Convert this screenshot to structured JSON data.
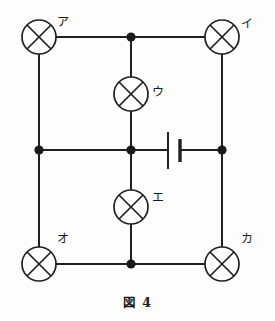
{
  "figure": {
    "caption": "図 4",
    "caption_label": "図",
    "caption_number": "4",
    "line_color": "#231f20",
    "background_color": "#fdfdfc"
  },
  "diagram": {
    "type": "electrical-circuit-schematic",
    "lamps": [
      {
        "id": "lamp-a",
        "label": "ア",
        "cx": 39,
        "cy": 37,
        "r": 17,
        "label_x": 57,
        "label_y": 16,
        "position": "top-left"
      },
      {
        "id": "lamp-i",
        "label": "イ",
        "cx": 222,
        "cy": 37,
        "r": 17,
        "label_x": 241,
        "label_y": 18,
        "position": "top-right"
      },
      {
        "id": "lamp-u",
        "label": "ウ",
        "cx": 131,
        "cy": 94,
        "r": 17,
        "label_x": 152,
        "label_y": 86,
        "position": "upper-middle-branch"
      },
      {
        "id": "lamp-e",
        "label": "エ",
        "cx": 131,
        "cy": 207,
        "r": 17,
        "label_x": 152,
        "label_y": 192,
        "position": "lower-middle-branch"
      },
      {
        "id": "lamp-o",
        "label": "オ",
        "cx": 39,
        "cy": 264,
        "r": 17,
        "label_x": 57,
        "label_y": 233,
        "position": "bottom-left"
      },
      {
        "id": "lamp-ka",
        "label": "カ",
        "cx": 222,
        "cy": 264,
        "r": 17,
        "label_x": 241,
        "label_y": 233,
        "position": "bottom-right"
      }
    ],
    "battery": {
      "id": "battery",
      "long_plate_x": 168,
      "long_plate_y1": 132,
      "long_plate_y2": 169,
      "short_plate_x": 180,
      "short_plate_y1": 139,
      "short_plate_y2": 162,
      "on_wire": "middle-horizontal"
    },
    "junctions": [
      {
        "id": "junction-top-center",
        "cx": 131,
        "cy": 37,
        "r": 4.6
      },
      {
        "id": "junction-middle-left",
        "cx": 39,
        "cy": 150,
        "r": 4.6
      },
      {
        "id": "junction-center",
        "cx": 131,
        "cy": 150,
        "r": 4.6
      },
      {
        "id": "junction-middle-right",
        "cx": 222,
        "cy": 150,
        "r": 4.6
      },
      {
        "id": "junction-bottom-center",
        "cx": 131,
        "cy": 264,
        "r": 4.6
      }
    ],
    "wires": [
      {
        "id": "wire-top-left",
        "x1": 56,
        "y1": 37,
        "x2": 131,
        "y2": 37
      },
      {
        "id": "wire-top-right",
        "x1": 131,
        "y1": 37,
        "x2": 205,
        "y2": 37
      },
      {
        "id": "wire-left-upper",
        "x1": 39,
        "y1": 54,
        "x2": 39,
        "y2": 150
      },
      {
        "id": "wire-left-lower",
        "x1": 39,
        "y1": 150,
        "x2": 39,
        "y2": 247
      },
      {
        "id": "wire-right-upper",
        "x1": 222,
        "y1": 54,
        "x2": 222,
        "y2": 150
      },
      {
        "id": "wire-right-lower",
        "x1": 222,
        "y1": 150,
        "x2": 222,
        "y2": 247
      },
      {
        "id": "wire-center-top-to-lampu",
        "x1": 131,
        "y1": 37,
        "x2": 131,
        "y2": 77
      },
      {
        "id": "wire-lampu-to-center",
        "x1": 131,
        "y1": 111,
        "x2": 131,
        "y2": 150
      },
      {
        "id": "wire-center-to-lampe",
        "x1": 131,
        "y1": 150,
        "x2": 131,
        "y2": 190
      },
      {
        "id": "wire-lampe-to-bottom",
        "x1": 131,
        "y1": 224,
        "x2": 131,
        "y2": 264
      },
      {
        "id": "wire-middle-left",
        "x1": 39,
        "y1": 150,
        "x2": 131,
        "y2": 150
      },
      {
        "id": "wire-middle-to-battery",
        "x1": 131,
        "y1": 150,
        "x2": 168,
        "y2": 150
      },
      {
        "id": "wire-battery-to-right",
        "x1": 180,
        "y1": 150,
        "x2": 222,
        "y2": 150
      },
      {
        "id": "wire-bottom-left",
        "x1": 56,
        "y1": 264,
        "x2": 131,
        "y2": 264
      },
      {
        "id": "wire-bottom-right",
        "x1": 131,
        "y1": 264,
        "x2": 205,
        "y2": 264
      }
    ]
  }
}
